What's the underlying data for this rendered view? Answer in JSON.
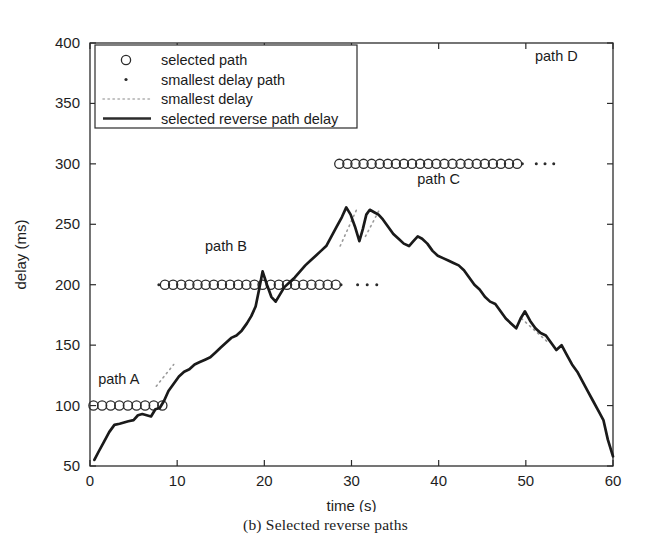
{
  "caption": "(b) Selected reverse paths",
  "axes": {
    "xlabel": "time (s)",
    "ylabel": "delay (ms)",
    "xticks": [
      "0",
      "10",
      "20",
      "30",
      "40",
      "50",
      "60"
    ],
    "yticks": [
      "50",
      "100",
      "150",
      "200",
      "250",
      "300",
      "350",
      "400"
    ]
  },
  "legend": {
    "items": [
      {
        "label": "selected path",
        "marker": "circle-marker"
      },
      {
        "label": "smallest delay path",
        "marker": "dot-marker"
      },
      {
        "label": "smallest delay",
        "marker": "dotted-line-marker"
      },
      {
        "label": "selected reverse path delay",
        "marker": "solid-line-marker"
      }
    ]
  },
  "annotations": [
    {
      "name": "path-a-label",
      "text": "path A",
      "x": 3.3,
      "y": 118
    },
    {
      "name": "path-b-label",
      "text": "path B",
      "x": 15.6,
      "y": 228
    },
    {
      "name": "path-c-label",
      "text": "path C",
      "x": 40.0,
      "y": 283
    },
    {
      "name": "path-d-label",
      "text": "path D",
      "x": 53.5,
      "y": 385
    }
  ],
  "chart_data": {
    "type": "line",
    "title": "",
    "xlabel": "time (s)",
    "ylabel": "delay (ms)",
    "xlim": [
      0,
      60
    ],
    "ylim": [
      50,
      400
    ],
    "xticks": [
      0,
      10,
      20,
      30,
      40,
      50,
      60
    ],
    "yticks": [
      50,
      100,
      150,
      200,
      250,
      300,
      350,
      400
    ],
    "grid": false,
    "legend_position": "upper-left-inside",
    "series": [
      {
        "name": "selected reverse path delay",
        "style": "solid-line",
        "color": "#1a1a1a",
        "x": [
          0.5,
          1.0,
          1.6,
          2.2,
          2.8,
          3.4,
          3.9,
          4.4,
          5.0,
          5.5,
          6.0,
          6.5,
          7.0,
          7.5,
          8.0,
          8.5,
          9.0,
          9.6,
          10.2,
          10.8,
          11.4,
          12.0,
          12.6,
          13.2,
          13.8,
          14.4,
          15.0,
          15.6,
          16.2,
          16.8,
          17.4,
          18.0,
          18.5,
          19.0,
          19.4,
          19.8,
          20.3,
          20.8,
          21.3,
          21.8,
          22.3,
          22.9,
          23.5,
          24.1,
          24.7,
          25.3,
          25.9,
          26.5,
          27.1,
          27.7,
          28.3,
          28.9,
          29.4,
          29.9,
          30.4,
          30.9,
          31.3,
          31.7,
          32.1,
          32.6,
          33.1,
          33.6,
          34.2,
          34.8,
          35.4,
          36.0,
          36.6,
          37.1,
          37.6,
          38.1,
          38.7,
          39.3,
          39.9,
          40.5,
          41.1,
          41.7,
          42.3,
          42.9,
          43.5,
          44.1,
          44.7,
          45.3,
          45.9,
          46.5,
          47.1,
          47.7,
          48.3,
          48.9,
          49.4,
          49.9,
          50.5,
          51.1,
          51.7,
          52.3,
          52.9,
          53.5,
          54.1,
          54.7,
          55.3,
          55.9,
          56.5,
          57.1,
          57.7,
          58.3,
          58.9,
          59.4,
          60.0
        ],
        "y": [
          55,
          62,
          70,
          78,
          84,
          85,
          86,
          87,
          88,
          92,
          93,
          92,
          91,
          97,
          98,
          104,
          112,
          118,
          124,
          128,
          130,
          134,
          136,
          138,
          140,
          144,
          148,
          152,
          156,
          158,
          162,
          168,
          174,
          182,
          196,
          211,
          200,
          190,
          186,
          192,
          198,
          202,
          206,
          211,
          216,
          220,
          224,
          228,
          232,
          240,
          248,
          256,
          264,
          258,
          248,
          236,
          246,
          258,
          262,
          260,
          258,
          254,
          248,
          242,
          238,
          234,
          232,
          236,
          240,
          238,
          234,
          228,
          224,
          222,
          220,
          218,
          216,
          212,
          206,
          200,
          196,
          190,
          186,
          184,
          178,
          172,
          168,
          164,
          172,
          178,
          170,
          164,
          160,
          158,
          152,
          146,
          150,
          142,
          134,
          128,
          120,
          112,
          104,
          96,
          88,
          72,
          58
        ]
      },
      {
        "name": "selected path A",
        "style": "circle-markers",
        "y_level": 100,
        "x_start": 0.4,
        "x_end": 8.3,
        "marker_count": 9
      },
      {
        "name": "selected path B",
        "style": "circle-markers",
        "y_level": 200,
        "x_start": 8.6,
        "x_end": 28.2,
        "marker_count": 22
      },
      {
        "name": "selected path C",
        "style": "circle-markers",
        "y_level": 300,
        "x_start": 28.6,
        "x_end": 49.0,
        "marker_count": 23
      },
      {
        "name": "smallest delay path B",
        "style": "dot-markers",
        "y_level": 200,
        "dots_x": [
          7.9,
          28.8,
          30.7,
          31.8,
          32.9
        ]
      },
      {
        "name": "smallest delay path C",
        "style": "dot-markers",
        "y_level": 300,
        "dots_x": [
          49.6,
          51.2,
          52.2,
          53.2
        ]
      },
      {
        "name": "smallest delay segments",
        "style": "dotted-line",
        "segments": [
          {
            "x": [
              7.6,
              9.6
            ],
            "y": [
              116,
              134
            ]
          },
          {
            "x": [
              28.7,
              30.7
            ],
            "y": [
              232,
              264
            ]
          },
          {
            "x": [
              31.6,
              33.2
            ],
            "y": [
              240,
              262
            ]
          },
          {
            "x": [
              49.5,
              52.6
            ],
            "y": [
              172,
              152
            ]
          }
        ]
      }
    ]
  }
}
